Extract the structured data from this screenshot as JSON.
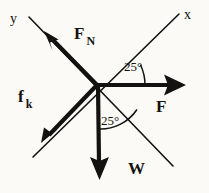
{
  "figure": {
    "background_color": "#fbfaf6",
    "stroke_color": "#141210",
    "origin": {
      "x": 97,
      "y": 85
    }
  },
  "axes": [
    {
      "name": "x-axis",
      "label": "x",
      "tilt_degrees": 25,
      "from": {
        "x": 33,
        "y": 157
      },
      "to": {
        "x": 179,
        "y": 14
      },
      "stroke_width": 1.6
    },
    {
      "name": "y-axis",
      "label": "y",
      "tilt_degrees": 25,
      "from": {
        "x": 29,
        "y": 17
      },
      "to": {
        "x": 173,
        "y": 166
      },
      "stroke_width": 1.6
    }
  ],
  "vectors": [
    {
      "name": "normal-force",
      "label": "F",
      "subscript": "N",
      "direction": "up-left along +y axis",
      "from": {
        "x": 97,
        "y": 85
      },
      "to": {
        "x": 45,
        "y": 32
      },
      "stroke_width": 4.2
    },
    {
      "name": "kinetic-friction-force",
      "label": "f",
      "subscript": "k",
      "direction": "down-left along -x axis",
      "from": {
        "x": 97,
        "y": 85
      },
      "to": {
        "x": 42,
        "y": 142
      },
      "stroke_width": 4.2
    },
    {
      "name": "applied-force",
      "label": "F",
      "subscript": "",
      "direction": "horizontal right",
      "from": {
        "x": 97,
        "y": 85
      },
      "to": {
        "x": 186,
        "y": 85
      },
      "stroke_width": 4.2
    },
    {
      "name": "weight-force",
      "label": "W",
      "subscript": "",
      "direction": "vertically down",
      "from": {
        "x": 97,
        "y": 85
      },
      "to": {
        "x": 99,
        "y": 179
      },
      "stroke_width": 4.2
    }
  ],
  "angles": [
    {
      "name": "angle-between-applied-force-and-x-axis",
      "value": "25°",
      "between": [
        "applied-force",
        "x-axis"
      ],
      "radius": 48
    },
    {
      "name": "angle-between-weight-and-y-axis",
      "value": "25°",
      "between": [
        "weight-force",
        "y-axis"
      ],
      "radius": 44
    }
  ]
}
